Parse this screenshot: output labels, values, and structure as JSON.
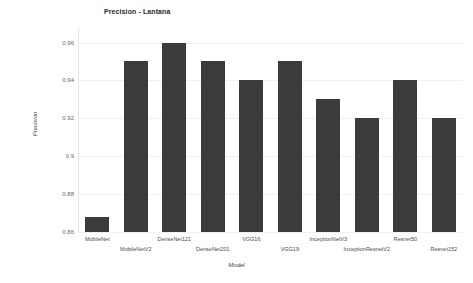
{
  "chart_data": {
    "type": "bar",
    "title": "Precision - Lantana",
    "xlabel": "Model",
    "ylabel": "Precision",
    "categories": [
      "MobileNet",
      "MobileNetV2",
      "DenseNet121",
      "DenseNet201",
      "VGG16",
      "VGG19",
      "InceptionNetV3",
      "InceptionResnetV2",
      "Resnet50",
      "Resnet152"
    ],
    "values": [
      0.868,
      0.95,
      0.96,
      0.95,
      0.94,
      0.95,
      0.93,
      0.92,
      0.94,
      0.92
    ],
    "ylim": [
      0.86,
      0.965
    ],
    "yticks": [
      0.96,
      0.94,
      0.92,
      0.9,
      0.88,
      0.86
    ],
    "ytick_labels": [
      "0.96",
      "0.94",
      "0.92",
      "0.9",
      "0.88",
      "0.86"
    ],
    "grid": true,
    "legend": false,
    "bar_color": "#3b3b3b",
    "background_color": "#ffffff"
  }
}
